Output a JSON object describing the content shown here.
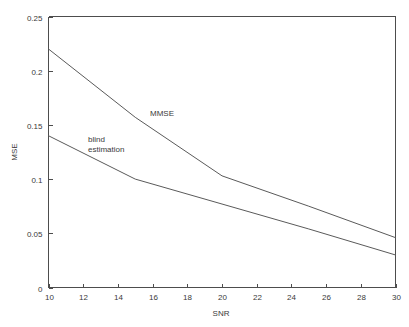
{
  "chart_data": {
    "type": "line",
    "title": "",
    "xlabel": "SNR",
    "ylabel": "MSE",
    "xlim": [
      10,
      30
    ],
    "ylim": [
      0,
      0.25
    ],
    "grid": false,
    "legend_position": "inline-annotations",
    "xticks": [
      "10",
      "12",
      "14",
      "16",
      "18",
      "20",
      "22",
      "24",
      "26",
      "28",
      "30"
    ],
    "xtick_values": [
      10,
      12,
      14,
      16,
      18,
      20,
      22,
      24,
      26,
      28,
      30
    ],
    "yticks": [
      "0",
      "0.05",
      "0.1",
      "0.15",
      "0.2",
      "0.25"
    ],
    "ytick_values": [
      0,
      0.05,
      0.1,
      0.15,
      0.2,
      0.25
    ],
    "x": [
      10,
      15,
      20,
      25,
      30
    ],
    "series": [
      {
        "name": "MMSE",
        "values": [
          0.22,
          0.157,
          0.103,
          0.075,
          0.046
        ],
        "color": "#5a5a5a",
        "annotation": "MMSE",
        "annotation_x": 18.0,
        "annotation_y": 0.163
      },
      {
        "name": "blind estimation",
        "values": [
          0.14,
          0.1,
          0.077,
          0.054,
          0.03
        ],
        "color": "#5a5a5a",
        "annotation": "blind estimation",
        "annotation_line1": "blind",
        "annotation_line2": "estimation",
        "annotation_x": 13.1,
        "annotation_y": 0.128
      }
    ]
  }
}
